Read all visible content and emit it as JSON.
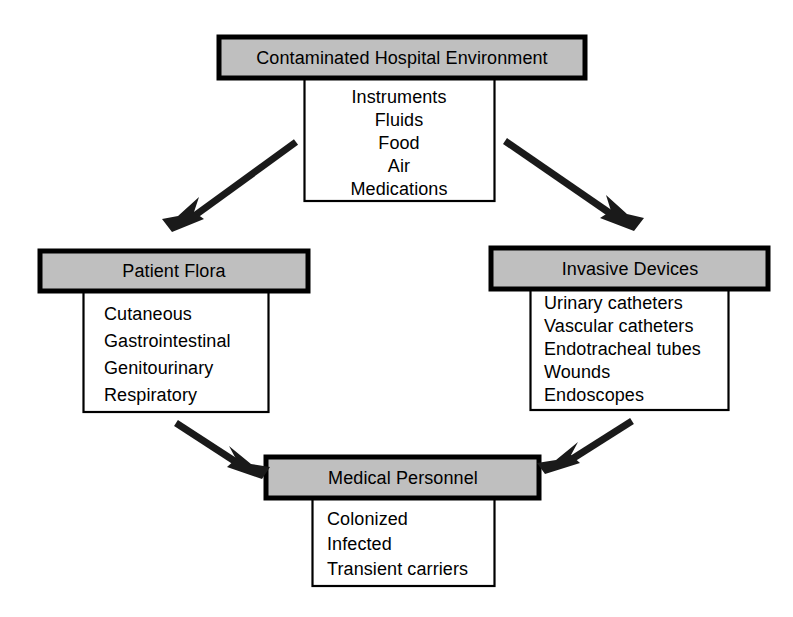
{
  "diagram": {
    "theme": {
      "header_fill": "#bfbfbf",
      "body_fill": "#ffffff",
      "stroke": "#000000",
      "background": "#ffffff",
      "arrow_color": "#1a1a1a"
    },
    "nodes": [
      {
        "id": "contaminated-hospital-environment",
        "header": "Contaminated Hospital Environment",
        "align": "center",
        "items": [
          "Instruments",
          "Fluids",
          "Food",
          "Air",
          "Medications"
        ]
      },
      {
        "id": "patient-flora",
        "header": "Patient Flora",
        "align": "left",
        "items": [
          "Cutaneous",
          "Gastrointestinal",
          "Genitourinary",
          "Respiratory"
        ]
      },
      {
        "id": "invasive-devices",
        "header": "Invasive Devices",
        "align": "left",
        "items": [
          "Urinary catheters",
          "Vascular catheters",
          "Endotracheal tubes",
          "Wounds",
          "Endoscopes"
        ]
      },
      {
        "id": "medical-personnel",
        "header": "Medical Personnel",
        "align": "left",
        "items": [
          "Colonized",
          "Infected",
          "Transient carriers"
        ]
      }
    ],
    "edges": [
      {
        "id": "env-to-patient-flora",
        "from": "contaminated-hospital-environment",
        "to": "patient-flora"
      },
      {
        "id": "env-to-invasive-devices",
        "from": "contaminated-hospital-environment",
        "to": "invasive-devices"
      },
      {
        "id": "patient-flora-to-medical-personnel",
        "from": "patient-flora",
        "to": "medical-personnel"
      },
      {
        "id": "invasive-devices-to-medical-personnel",
        "from": "invasive-devices",
        "to": "medical-personnel"
      }
    ]
  }
}
